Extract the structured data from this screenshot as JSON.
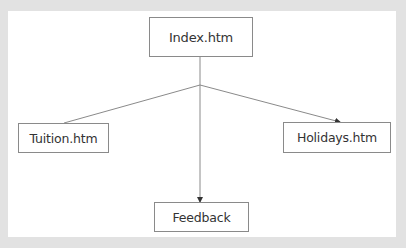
{
  "diagram": {
    "type": "site-map",
    "nodes": [
      {
        "id": "index",
        "label": "Index.htm"
      },
      {
        "id": "tuition",
        "label": "Tuition.htm"
      },
      {
        "id": "holidays",
        "label": "Holidays.htm"
      },
      {
        "id": "feedback",
        "label": "Feedback"
      }
    ],
    "edges": [
      {
        "from": "index",
        "to": "tuition",
        "arrow": false
      },
      {
        "from": "index",
        "to": "holidays",
        "arrow": true
      },
      {
        "from": "index",
        "to": "feedback",
        "arrow": true
      }
    ]
  },
  "colors": {
    "background": "#e2e2e2",
    "panel": "#ffffff",
    "line": "#8a8a8a",
    "text": "#333333"
  }
}
